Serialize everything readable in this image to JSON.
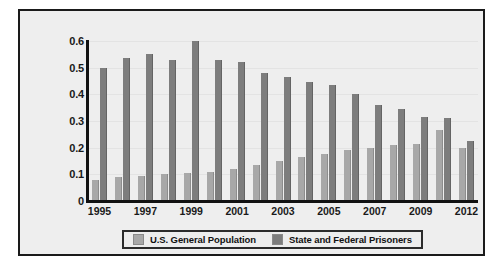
{
  "chart_data": {
    "type": "bar",
    "title": "",
    "subtitle": "",
    "xlabel": "",
    "ylabel": "",
    "ylim": [
      0,
      0.6
    ],
    "xlim_categories_count": 17,
    "grid": true,
    "legend_position": "bottom",
    "ytick_labels": [
      "0.6",
      "0.5",
      "0.4",
      "0.3",
      "0.2",
      "0.1",
      "0"
    ],
    "ytick_values": [
      0.6,
      0.5,
      0.4,
      0.3,
      0.2,
      0.1,
      0
    ],
    "categories": [
      "1995",
      "1996",
      "1997",
      "1998",
      "1999",
      "2000",
      "2001",
      "2002",
      "2003",
      "2004",
      "2005",
      "2006",
      "2007",
      "2008",
      "2009",
      "2010",
      "2012"
    ],
    "xtick_labels_shown": [
      "1995",
      "1997",
      "1999",
      "2001",
      "2003",
      "2005",
      "2007",
      "2009",
      "2012"
    ],
    "series": [
      {
        "name": "U.S. General Population",
        "color": "#a8a8a8",
        "values": [
          0.08,
          0.09,
          0.095,
          0.1,
          0.105,
          0.11,
          0.12,
          0.135,
          0.15,
          0.165,
          0.175,
          0.19,
          0.2,
          0.21,
          0.215,
          0.265,
          0.2
        ]
      },
      {
        "name": "State and Federal Prisoners",
        "color": "#7d7d7d",
        "values": [
          0.5,
          0.535,
          0.55,
          0.53,
          0.6,
          0.53,
          0.52,
          0.48,
          0.465,
          0.445,
          0.435,
          0.4,
          0.36,
          0.345,
          0.315,
          0.31,
          0.225
        ]
      }
    ]
  },
  "legend": {
    "items": [
      {
        "label": "U.S. General Population",
        "color": "#a8a8a8"
      },
      {
        "label": "State and Federal Prisoners",
        "color": "#7d7d7d"
      }
    ]
  },
  "colors": {
    "panel_background": "#eeeeee",
    "panel_border": "#1a1a1a",
    "axis": "#111111",
    "gridline": "#e3e3e3",
    "series_light": "#a8a8a8",
    "series_dark": "#7d7d7d"
  }
}
